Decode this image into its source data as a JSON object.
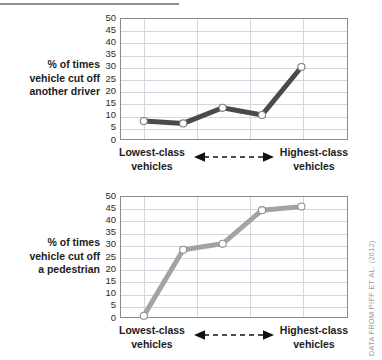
{
  "rule": {
    "name": "top-divider"
  },
  "credit": "DATA FROM PIFF ET AL. (2012)",
  "axis": {
    "x_left_label_line1": "Lowest-class",
    "x_left_label_line2": "vehicles",
    "x_right_label_line1": "Highest-class",
    "x_right_label_line2": "vehicles",
    "y_ticks": [
      "50",
      "45",
      "40",
      "35",
      "30",
      "25",
      "20",
      "15",
      "10",
      "5",
      "0"
    ]
  },
  "panels": [
    {
      "id": "drivers",
      "ytitle_line1": "% of times",
      "ytitle_line2": "vehicle cut off",
      "ytitle_line3": "another driver",
      "line_color": "#4a4a4a",
      "marker_fill": "#ffffff",
      "marker_stroke": "#7d7d7d"
    },
    {
      "id": "pedestrians",
      "ytitle_line1": "% of times",
      "ytitle_line2": "vehicle cut off",
      "ytitle_line3": "a pedestrian",
      "line_color": "#a3a3a3",
      "marker_fill": "#ffffff",
      "marker_stroke": "#8f8f8f"
    }
  ],
  "chart_data": [
    {
      "type": "line",
      "title": "% of times vehicle cut off another driver",
      "xlabel": "Lowest-class vehicles ↔ Highest-class vehicles",
      "ylabel": "% of times vehicle cut off another driver",
      "categories": [
        "1",
        "2",
        "3",
        "4",
        "5"
      ],
      "x": [
        1,
        2,
        3,
        4,
        5
      ],
      "values": [
        7.5,
        6.5,
        13.0,
        10.0,
        30.0
      ],
      "ylim": [
        0,
        50
      ],
      "yticks": [
        0,
        5,
        10,
        15,
        20,
        25,
        30,
        35,
        40,
        45,
        50
      ],
      "grid": true,
      "legend": "none",
      "line_color": "#4a4a4a",
      "marker": "circle-open",
      "annotation": "DATA FROM PIFF ET AL. (2012)"
    },
    {
      "type": "line",
      "title": "% of times vehicle cut off a pedestrian",
      "xlabel": "Lowest-class vehicles ↔ Highest-class vehicles",
      "ylabel": "% of times vehicle cut off a pedestrian",
      "categories": [
        "1",
        "2",
        "3",
        "4",
        "5"
      ],
      "x": [
        1,
        2,
        3,
        4,
        5
      ],
      "values": [
        0.5,
        28.0,
        30.5,
        44.5,
        46.0
      ],
      "ylim": [
        0,
        50
      ],
      "yticks": [
        0,
        5,
        10,
        15,
        20,
        25,
        30,
        35,
        40,
        45,
        50
      ],
      "grid": true,
      "legend": "none",
      "line_color": "#a3a3a3",
      "marker": "circle-open",
      "annotation": "DATA FROM PIFF ET AL. (2012)"
    }
  ]
}
